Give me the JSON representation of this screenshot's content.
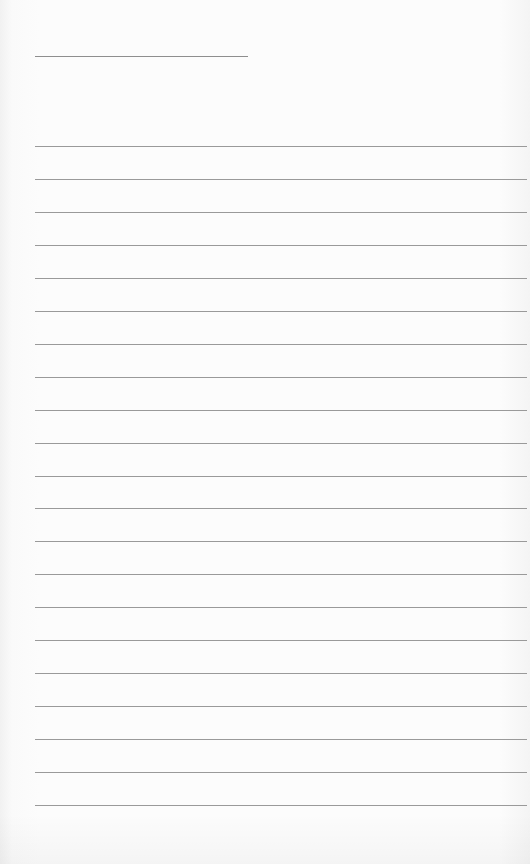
{
  "page": {
    "type": "lined-paper",
    "background_color": "#fbfbfb",
    "line_color": "#9a9a9a",
    "header_line": {
      "x": 35,
      "y": 56,
      "width": 213
    },
    "ruled_lines": {
      "count": 21,
      "start_y": 146,
      "spacing": 32.95,
      "x": 35,
      "width": 492
    }
  }
}
